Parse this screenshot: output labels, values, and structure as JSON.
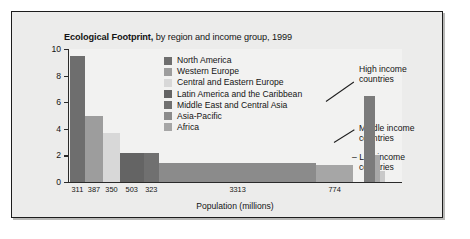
{
  "chart_data": {
    "type": "bar",
    "title": "Ecological Footprint, by region and income group, 1999",
    "title_bold_part": "Ecological Footprint,",
    "title_rest": " by region and income group, 1999",
    "xlabel": "Population (millions)",
    "ylabel": "Global hectares per person",
    "ylim": [
      0,
      10
    ],
    "yticks": [
      "0",
      "2",
      "4",
      "6",
      "8",
      "10"
    ],
    "grid": false,
    "legend_position": "inside-top-center",
    "categories": [
      "North America",
      "Western Europe",
      "Central and Eastern Europe",
      "Latin America and the Caribbean",
      "Middle East and Central Asia",
      "Asia-Pacific",
      "Africa"
    ],
    "values": [
      9.5,
      5.0,
      3.7,
      2.2,
      2.15,
      1.4,
      1.3
    ],
    "widths": [
      311,
      387,
      350,
      503,
      323,
      3313,
      774
    ],
    "xtick_labels": [
      "311",
      "387",
      "350",
      "503",
      "323",
      "3313",
      "774"
    ],
    "colors": [
      "#6e6e6e",
      "#9d9d9d",
      "#d8d8d8",
      "#646464",
      "#707070",
      "#8b8b8b",
      "#a6a6a6"
    ],
    "income_groups": {
      "categories": [
        "High income countries",
        "Middle income countries",
        "Low income countries"
      ],
      "values": [
        6.5,
        2.0,
        0.8
      ],
      "colors": [
        "#7b7b7b",
        "#a8a8a8",
        "#c9c9c9"
      ]
    },
    "annotations": [
      "High income\ncountries",
      "Middle income\ncountries",
      "Low income\ncountries"
    ]
  },
  "legend": {
    "items": [
      {
        "label": "North America",
        "color": "#6e6e6e"
      },
      {
        "label": "Western Europe",
        "color": "#9d9d9d"
      },
      {
        "label": "Central and Eastern Europe",
        "color": "#d8d8d8"
      },
      {
        "label": "Latin America and the Caribbean",
        "color": "#646464"
      },
      {
        "label": "Middle East and Central Asia",
        "color": "#707070"
      },
      {
        "label": "Asia-Pacific",
        "color": "#8b8b8b"
      },
      {
        "label": "Africa",
        "color": "#a6a6a6"
      }
    ]
  },
  "annotations": {
    "high_line1": "High income",
    "high_line2": "countries",
    "mid_line1": "Middle income",
    "mid_line2": "countries",
    "low_line1": "Low income",
    "low_line2": "countries",
    "low_dash": "–"
  },
  "yticks": [
    {
      "label": "10",
      "value": 10
    },
    {
      "label": "8",
      "value": 8
    },
    {
      "label": "6",
      "value": 6
    },
    {
      "label": "4",
      "value": 4
    },
    {
      "label": "2",
      "value": 2
    },
    {
      "label": "0",
      "value": 0
    }
  ]
}
